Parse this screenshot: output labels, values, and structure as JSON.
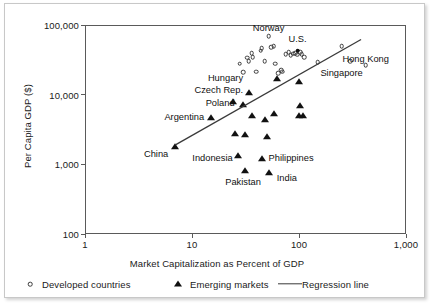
{
  "chart_data": {
    "type": "scatter",
    "title": "",
    "xlabel": "Market Capitalization as Percent of GDP",
    "ylabel": "Per Capita GDP ($)",
    "xscale": "log",
    "yscale": "log",
    "xlim": [
      1,
      1000
    ],
    "ylim": [
      100,
      100000
    ],
    "xticks": [
      "1",
      "10",
      "100",
      "1,000"
    ],
    "xtick_values": [
      1,
      10,
      100,
      1000
    ],
    "yticks": [
      "100",
      "1,000",
      "10,000",
      "100,000"
    ],
    "ytick_values": [
      100,
      1000,
      10000,
      100000
    ],
    "grid": false,
    "legend_position": "below",
    "series": [
      {
        "name": "Developed countries",
        "marker": "open-circle",
        "points": [
          {
            "x": 28,
            "y": 28000
          },
          {
            "x": 30,
            "y": 21000
          },
          {
            "x": 33,
            "y": 34000
          },
          {
            "x": 34,
            "y": 30000
          },
          {
            "x": 36,
            "y": 39000
          },
          {
            "x": 37,
            "y": 34500
          },
          {
            "x": 40,
            "y": 21500
          },
          {
            "x": 44,
            "y": 43000
          },
          {
            "x": 45,
            "y": 46500
          },
          {
            "x": 48,
            "y": 30000
          },
          {
            "x": 52,
            "y": 69000
          },
          {
            "x": 55,
            "y": 48000
          },
          {
            "x": 58,
            "y": 50000
          },
          {
            "x": 60,
            "y": 28000
          },
          {
            "x": 64,
            "y": 20500
          },
          {
            "x": 68,
            "y": 22500
          },
          {
            "x": 70,
            "y": 21500
          },
          {
            "x": 75,
            "y": 38000
          },
          {
            "x": 80,
            "y": 41000
          },
          {
            "x": 84,
            "y": 36500
          },
          {
            "x": 88,
            "y": 38500
          },
          {
            "x": 92,
            "y": 39500
          },
          {
            "x": 96,
            "y": 37500
          },
          {
            "x": 102,
            "y": 40500
          },
          {
            "x": 106,
            "y": 38000
          },
          {
            "x": 112,
            "y": 34500
          },
          {
            "x": 150,
            "y": 29000
          },
          {
            "x": 250,
            "y": 50000
          },
          {
            "x": 300,
            "y": 30000
          },
          {
            "x": 420,
            "y": 26500
          }
        ]
      },
      {
        "name": "United States",
        "marker": "filled-dot",
        "points": [
          {
            "x": 97,
            "y": 43000
          }
        ]
      },
      {
        "name": "Emerging markets",
        "marker": "filled-triangle",
        "points": [
          {
            "x": 7,
            "y": 1750
          },
          {
            "x": 15,
            "y": 4700
          },
          {
            "x": 24,
            "y": 7900
          },
          {
            "x": 25,
            "y": 2700
          },
          {
            "x": 27,
            "y": 1300
          },
          {
            "x": 30,
            "y": 7100
          },
          {
            "x": 31,
            "y": 2600
          },
          {
            "x": 31,
            "y": 790
          },
          {
            "x": 34,
            "y": 10700
          },
          {
            "x": 36,
            "y": 4900
          },
          {
            "x": 45,
            "y": 1200
          },
          {
            "x": 48,
            "y": 4400
          },
          {
            "x": 50,
            "y": 2500
          },
          {
            "x": 52,
            "y": 760
          },
          {
            "x": 58,
            "y": 5200
          },
          {
            "x": 62,
            "y": 17000
          },
          {
            "x": 100,
            "y": 15000
          },
          {
            "x": 102,
            "y": 6800
          },
          {
            "x": 100,
            "y": 4950
          },
          {
            "x": 108,
            "y": 4900
          }
        ]
      }
    ],
    "regression_line": {
      "name": "Regression line",
      "x_start": 7,
      "y_start": 1900,
      "x_end": 380,
      "y_end": 62000
    },
    "annotations": [
      {
        "text": "Norway",
        "x": 52,
        "y": 92000,
        "align": "center"
      },
      {
        "text": "U.S.",
        "x": 97,
        "y": 62000,
        "align": "center"
      },
      {
        "text": "Hong Kong",
        "x": 420,
        "y": 33000,
        "align": "center"
      },
      {
        "text": "Singapore",
        "x": 250,
        "y": 20500,
        "align": "center"
      },
      {
        "text": "Hungary",
        "x": 30,
        "y": 17500,
        "align": "right"
      },
      {
        "text": "Czech Rep.",
        "x": 30,
        "y": 11800,
        "align": "right"
      },
      {
        "text": "Poland",
        "x": 25,
        "y": 7600,
        "align": "right"
      },
      {
        "text": "Argentina",
        "x": 13,
        "y": 4850,
        "align": "right"
      },
      {
        "text": "China",
        "x": 6,
        "y": 1400,
        "align": "right"
      },
      {
        "text": "Indonesia",
        "x": 24,
        "y": 1250,
        "align": "right"
      },
      {
        "text": "Philippines",
        "x": 52,
        "y": 1230,
        "align": "left"
      },
      {
        "text": "Pakistan",
        "x": 30,
        "y": 560,
        "align": "center"
      },
      {
        "text": "India",
        "x": 62,
        "y": 640,
        "align": "left"
      }
    ],
    "legend": [
      {
        "label": "Developed countries",
        "marker": "open-circle"
      },
      {
        "label": "Emerging markets",
        "marker": "filled-triangle"
      },
      {
        "label": "Regression line",
        "marker": "line"
      }
    ]
  }
}
